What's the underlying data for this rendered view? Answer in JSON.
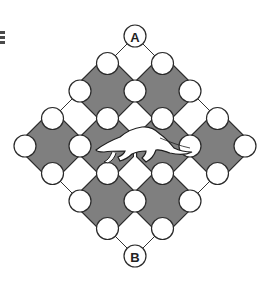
{
  "figure": {
    "type": "puzzle-board",
    "start_label": "A",
    "end_label": "B",
    "center_figure": "anteater",
    "colors": {
      "octagon_fill": "#7f7f7f",
      "outline": "#2a2a2a",
      "node_fill": "#ffffff",
      "background": "#ffffff"
    },
    "lattice": {
      "radius": 4,
      "nodes_rule": "|i|+|j|<=4 and i+j even",
      "gray_cells": [
        [
          -1,
          -2
        ],
        [
          1,
          -2
        ],
        [
          -3,
          0
        ],
        [
          -1,
          0
        ],
        [
          1,
          0
        ],
        [
          3,
          0
        ],
        [
          -1,
          2
        ],
        [
          1,
          2
        ]
      ],
      "white_cells": [
        [
          0,
          -3
        ],
        [
          -2,
          -1
        ],
        [
          0,
          -1
        ],
        [
          2,
          -1
        ],
        [
          -2,
          1
        ],
        [
          0,
          1
        ],
        [
          2,
          1
        ],
        [
          0,
          3
        ]
      ],
      "labeled_nodes": [
        {
          "cell": [
            0,
            -4
          ],
          "label": "A"
        },
        {
          "cell": [
            0,
            4
          ],
          "label": "B"
        }
      ],
      "hidden_nodes": [
        [
          0,
          0
        ]
      ]
    }
  },
  "icons": {
    "corner": "menu-icon"
  }
}
